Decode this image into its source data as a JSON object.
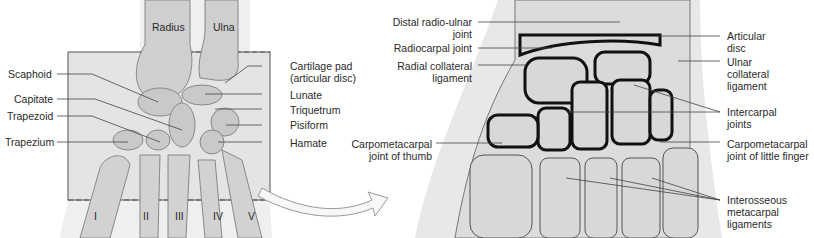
{
  "left_panel": {
    "bones_top": [
      "Radius",
      "Ulna"
    ],
    "labels_left": [
      "Scaphoid",
      "Capitate",
      "Trapezoid",
      "Trapezium"
    ],
    "labels_right": [
      "Cartilage pad",
      "(articular disc)",
      "Lunate",
      "Triquetrum",
      "Pisiform",
      "Hamate"
    ],
    "metacarpals": [
      "I",
      "II",
      "III",
      "IV",
      "V"
    ]
  },
  "right_panel": {
    "labels_left": [
      {
        "l1": "Distal radio-ulnar",
        "l2": "joint"
      },
      {
        "l1": "Radiocarpal joint",
        "l2": ""
      },
      {
        "l1": "Radial collateral",
        "l2": "ligament"
      },
      {
        "l1": "Carpometacarpal",
        "l2": "joint of thumb"
      }
    ],
    "labels_right": [
      {
        "l1": "Articular",
        "l2": "disc"
      },
      {
        "l1": "Ulnar",
        "l2": "collateral",
        "l3": "ligament"
      },
      {
        "l1": "Intercarpal",
        "l2": "joints"
      },
      {
        "l1": "Carpometacarpal",
        "l2": "joint of little finger"
      },
      {
        "l1": "Interosseous",
        "l2": "metacarpal",
        "l3": "ligaments"
      }
    ]
  },
  "colors": {
    "bone": "#d9d9d9",
    "bone_dark": "#9a9a9a",
    "joint": "#111111",
    "leader": "#444444",
    "box": "#e6e6e6"
  }
}
